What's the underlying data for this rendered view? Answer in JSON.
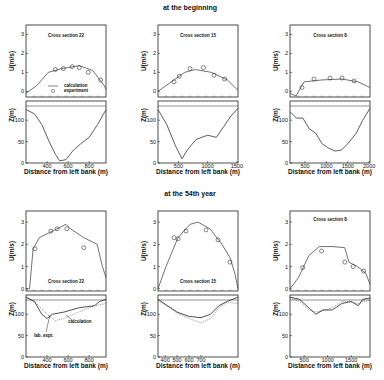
{
  "figure": {
    "row_titles": [
      "at the beginning",
      "at the 54th year"
    ],
    "xlabel": "Distance from left bank (m)",
    "u_ylabel": "U(m/s)",
    "z_ylabel": "Z(m)",
    "legend": {
      "calc": "calculation",
      "expt": "experiment"
    },
    "annotations": {
      "calc": "calculation",
      "lab": "lab. expt."
    }
  },
  "chart_data": [
    {
      "type": "line",
      "row": "at the beginning",
      "title": "Cross section 22",
      "u_panel": {
        "ylabel": "U(m/s)",
        "ylim": [
          -0.3,
          3.5
        ],
        "yticks": [
          0,
          1,
          2,
          3
        ],
        "xlim": [
          0,
          900
        ],
        "calc": [
          [
            0,
            -0.1
          ],
          [
            120,
            0.3
          ],
          [
            250,
            1.0
          ],
          [
            400,
            1.2
          ],
          [
            600,
            1.35
          ],
          [
            750,
            1.1
          ],
          [
            880,
            0.3
          ],
          [
            900,
            0.1
          ]
        ],
        "expt": [
          [
            330,
            1.15
          ],
          [
            420,
            1.2
          ],
          [
            520,
            1.3
          ],
          [
            600,
            1.25
          ],
          [
            700,
            1.0
          ],
          [
            840,
            0.6
          ]
        ]
      },
      "z_panel": {
        "ylabel": "Z(m)",
        "ylim": [
          0,
          145
        ],
        "yticks": [
          0,
          50,
          100
        ],
        "xticks": [
          400,
          600,
          800
        ],
        "xlim": [
          200,
          960
        ],
        "bed": [
          [
            200,
            125
          ],
          [
            280,
            115
          ],
          [
            350,
            90
          ],
          [
            420,
            50
          ],
          [
            480,
            20
          ],
          [
            520,
            5
          ],
          [
            580,
            8
          ],
          [
            650,
            30
          ],
          [
            720,
            45
          ],
          [
            800,
            60
          ],
          [
            880,
            90
          ],
          [
            960,
            125
          ]
        ]
      }
    },
    {
      "type": "line",
      "row": "at the beginning",
      "title": "Cross section 15",
      "u_panel": {
        "ylabel": "U(m/s)",
        "ylim": [
          -0.3,
          3.5
        ],
        "yticks": [
          0,
          1,
          2,
          3
        ],
        "xlim": [
          0,
          1500
        ],
        "calc": [
          [
            0,
            0
          ],
          [
            200,
            0.4
          ],
          [
            500,
            1.0
          ],
          [
            700,
            1.15
          ],
          [
            1000,
            1.0
          ],
          [
            1300,
            0.6
          ],
          [
            1500,
            0.05
          ]
        ],
        "expt": [
          [
            300,
            0.5
          ],
          [
            400,
            0.8
          ],
          [
            600,
            1.2
          ],
          [
            850,
            1.25
          ],
          [
            1050,
            0.85
          ],
          [
            1250,
            0.65
          ]
        ]
      },
      "z_panel": {
        "ylabel": "Z(m)",
        "ylim": [
          0,
          145
        ],
        "yticks": [
          0,
          50,
          100
        ],
        "xticks": [
          500,
          1000,
          1500
        ],
        "xlim": [
          150,
          1520
        ],
        "bed": [
          [
            150,
            125
          ],
          [
            300,
            90
          ],
          [
            450,
            40
          ],
          [
            560,
            10
          ],
          [
            650,
            30
          ],
          [
            800,
            55
          ],
          [
            1000,
            65
          ],
          [
            1150,
            60
          ],
          [
            1300,
            90
          ],
          [
            1400,
            110
          ],
          [
            1520,
            128
          ]
        ]
      }
    },
    {
      "type": "line",
      "row": "at the beginning",
      "title": "Cross section 8",
      "u_panel": {
        "ylabel": "U(m/s)",
        "ylim": [
          -0.3,
          3.5
        ],
        "yticks": [
          0,
          1,
          2,
          3
        ],
        "xlim": [
          0,
          2000
        ],
        "calc": [
          [
            0,
            -0.1
          ],
          [
            150,
            -0.25
          ],
          [
            350,
            0.5
          ],
          [
            800,
            0.6
          ],
          [
            1300,
            0.65
          ],
          [
            1700,
            0.5
          ],
          [
            2000,
            0.2
          ]
        ],
        "expt": [
          [
            300,
            0.2
          ],
          [
            600,
            0.65
          ],
          [
            1000,
            0.7
          ],
          [
            1300,
            0.7
          ],
          [
            1600,
            0.55
          ]
        ]
      },
      "z_panel": {
        "ylabel": "Z(m)",
        "ylim": [
          0,
          145
        ],
        "yticks": [
          0,
          50,
          100
        ],
        "xticks": [
          500,
          1000,
          1500,
          2000
        ],
        "xlim": [
          150,
          2020
        ],
        "bed": [
          [
            150,
            120
          ],
          [
            300,
            105
          ],
          [
            450,
            105
          ],
          [
            600,
            80
          ],
          [
            750,
            70
          ],
          [
            900,
            45
          ],
          [
            1050,
            35
          ],
          [
            1200,
            28
          ],
          [
            1350,
            30
          ],
          [
            1500,
            45
          ],
          [
            1700,
            70
          ],
          [
            1850,
            100
          ],
          [
            2020,
            128
          ]
        ]
      }
    },
    {
      "type": "line",
      "row": "at the 54th year",
      "title": "Cross section 22",
      "u_panel": {
        "ylabel": "U(m/s)",
        "ylim": [
          -0.1,
          3.5
        ],
        "yticks": [
          0,
          1,
          2,
          3
        ],
        "xlim": [
          0,
          900
        ],
        "calc": [
          [
            0,
            0
          ],
          [
            40,
            0
          ],
          [
            80,
            1.8
          ],
          [
            150,
            2.3
          ],
          [
            300,
            2.6
          ],
          [
            450,
            2.9
          ],
          [
            500,
            2.7
          ],
          [
            650,
            2.3
          ],
          [
            800,
            2.0
          ],
          [
            860,
            1.0
          ],
          [
            900,
            0.5
          ]
        ],
        "expt": [
          [
            100,
            1.8
          ],
          [
            280,
            2.6
          ],
          [
            350,
            2.7
          ],
          [
            460,
            2.7
          ],
          [
            650,
            1.85
          ]
        ]
      },
      "z_panel": {
        "ylabel": "Z(m)",
        "ylim": [
          0,
          145
        ],
        "yticks": [
          0,
          50,
          100
        ],
        "xticks": [
          400,
          600,
          800
        ],
        "xlim": [
          200,
          960
        ],
        "calc": [
          [
            200,
            140
          ],
          [
            280,
            130
          ],
          [
            350,
            100
          ],
          [
            400,
            90
          ],
          [
            450,
            100
          ],
          [
            560,
            105
          ],
          [
            700,
            115
          ],
          [
            850,
            120
          ],
          [
            900,
            130
          ],
          [
            960,
            135
          ]
        ],
        "lab_expt": [
          [
            200,
            140
          ],
          [
            300,
            125
          ],
          [
            400,
            100
          ],
          [
            480,
            85
          ],
          [
            560,
            90
          ],
          [
            700,
            105
          ],
          [
            850,
            120
          ],
          [
            960,
            125
          ]
        ]
      }
    },
    {
      "type": "line",
      "row": "at the 54th year",
      "title": "Cross section 15",
      "u_panel": {
        "ylabel": "U(m/s)",
        "ylim": [
          -0.1,
          3.5
        ],
        "yticks": [
          0,
          1,
          2,
          3
        ],
        "xlim": [
          0,
          1000
        ],
        "calc": [
          [
            0,
            0
          ],
          [
            100,
            1.0
          ],
          [
            250,
            2.3
          ],
          [
            400,
            2.9
          ],
          [
            500,
            3.0
          ],
          [
            650,
            2.7
          ],
          [
            800,
            2.0
          ],
          [
            900,
            1.4
          ],
          [
            960,
            0.7
          ],
          [
            1000,
            0
          ]
        ],
        "expt": [
          [
            200,
            2.3
          ],
          [
            250,
            2.25
          ],
          [
            350,
            2.6
          ],
          [
            600,
            2.65
          ],
          [
            750,
            2.2
          ],
          [
            900,
            1.2
          ]
        ]
      },
      "z_panel": {
        "ylabel": "Z(m)",
        "ylim": [
          0,
          145
        ],
        "yticks": [
          0,
          50,
          100
        ],
        "xticks": [
          400,
          500,
          600,
          700
        ],
        "xlim": [
          340,
          1010
        ],
        "calc": [
          [
            340,
            135
          ],
          [
            420,
            120
          ],
          [
            500,
            105
          ],
          [
            600,
            95
          ],
          [
            700,
            92
          ],
          [
            780,
            100
          ],
          [
            850,
            120
          ],
          [
            920,
            130
          ],
          [
            1010,
            140
          ]
        ],
        "lab_expt": [
          [
            340,
            132
          ],
          [
            420,
            118
          ],
          [
            500,
            103
          ],
          [
            600,
            90
          ],
          [
            700,
            80
          ],
          [
            780,
            90
          ],
          [
            850,
            115
          ],
          [
            920,
            128
          ],
          [
            1010,
            125
          ]
        ]
      }
    },
    {
      "type": "line",
      "row": "at the 54th year",
      "title": "Cross section 8",
      "u_panel": {
        "ylabel": "U(m/s)",
        "ylim": [
          -0.1,
          3.5
        ],
        "yticks": [
          0,
          1,
          2,
          3
        ],
        "xlim": [
          0,
          1900
        ],
        "calc": [
          [
            0,
            0
          ],
          [
            200,
            0.5
          ],
          [
            450,
            1.5
          ],
          [
            700,
            1.9
          ],
          [
            1000,
            1.9
          ],
          [
            1300,
            1.85
          ],
          [
            1400,
            1.2
          ],
          [
            1600,
            1.0
          ],
          [
            1800,
            0.7
          ],
          [
            1900,
            0.2
          ]
        ],
        "expt": [
          [
            300,
            0.95
          ],
          [
            750,
            1.7
          ],
          [
            1300,
            1.2
          ],
          [
            1500,
            1.0
          ],
          [
            1750,
            0.8
          ]
        ]
      },
      "z_panel": {
        "ylabel": "Z(m)",
        "ylim": [
          0,
          145
        ],
        "yticks": [
          0,
          50,
          100
        ],
        "xticks": [
          500,
          1000,
          1500
        ],
        "xlim": [
          200,
          1900
        ],
        "calc": [
          [
            200,
            140
          ],
          [
            400,
            135
          ],
          [
            600,
            115
          ],
          [
            750,
            100
          ],
          [
            900,
            110
          ],
          [
            1100,
            110
          ],
          [
            1300,
            125
          ],
          [
            1500,
            130
          ],
          [
            1650,
            120
          ],
          [
            1750,
            135
          ],
          [
            1900,
            138
          ]
        ],
        "lab_expt": [
          [
            200,
            138
          ],
          [
            400,
            130
          ],
          [
            600,
            110
          ],
          [
            750,
            105
          ],
          [
            900,
            108
          ],
          [
            1100,
            115
          ],
          [
            1300,
            130
          ],
          [
            1500,
            128
          ],
          [
            1650,
            125
          ],
          [
            1750,
            130
          ],
          [
            1900,
            132
          ]
        ]
      }
    }
  ]
}
